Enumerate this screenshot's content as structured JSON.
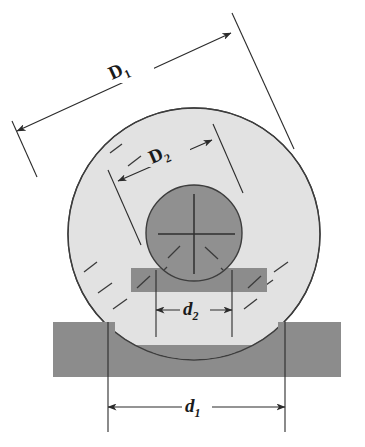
{
  "figure": {
    "background_color": "#ffffff"
  },
  "colors": {
    "outer_ring_fill": "#e2e2e2",
    "inner_shaft_fill": "#909090",
    "bar_fill": "#8c8c8c",
    "outline_stroke": "#3d3d3d",
    "dimension_stroke": "#2b2b2b",
    "label_color": "#1a1a1a"
  },
  "shapes": {
    "outer_circle": {
      "name": "outer-race",
      "cx": 194,
      "cy": 234,
      "r": 126,
      "fill": "#e2e2e2"
    },
    "inner_circle": {
      "name": "inner-shaft",
      "cx": 194,
      "cy": 233,
      "r": 48,
      "fill": "#909090"
    },
    "upper_bar": {
      "name": "upper-plate",
      "x": 131,
      "y": 268,
      "width": 136,
      "height": 24,
      "fill": "#8c8c8c"
    },
    "lower_bar": {
      "name": "lower-plate",
      "x": 53,
      "y": 322,
      "width": 288,
      "height": 55,
      "fill": "#8c8c8c"
    }
  },
  "dimensions": [
    {
      "id": "D1",
      "label": "D",
      "subscript": "1",
      "italic": false,
      "label_x": 128,
      "label_y": 78,
      "orientation": "diagonal",
      "arrow_start": {
        "x": 17,
        "y": 131
      },
      "arrow_end": {
        "x": 231,
        "y": 33
      },
      "describes": "outer race outside diameter"
    },
    {
      "id": "D2",
      "label": "D",
      "subscript": "2",
      "italic": false,
      "label_x": 167,
      "label_y": 162,
      "orientation": "diagonal",
      "arrow_start": {
        "x": 118,
        "y": 181
      },
      "arrow_end": {
        "x": 212,
        "y": 140
      },
      "describes": "outer race bore / inner race outside diameter"
    },
    {
      "id": "d2",
      "label": "d",
      "subscript": "2",
      "italic": true,
      "label_x": 194,
      "label_y": 313,
      "orientation": "horizontal",
      "arrow_start": {
        "x": 156,
        "y": 310
      },
      "arrow_end": {
        "x": 232,
        "y": 310
      },
      "describes": "inner shaft bore diameter"
    },
    {
      "id": "d1",
      "label": "d",
      "subscript": "1",
      "italic": true,
      "label_x": 196,
      "label_y": 411,
      "orientation": "horizontal",
      "arrow_start": {
        "x": 108,
        "y": 407
      },
      "arrow_end": {
        "x": 285,
        "y": 407
      },
      "describes": "lower plate aperture width"
    }
  ]
}
